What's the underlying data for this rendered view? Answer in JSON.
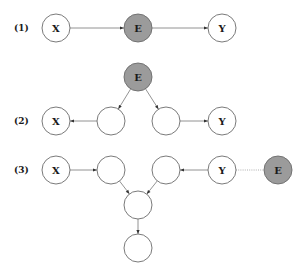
{
  "colors": {
    "observed_fill": "#9b9b9b",
    "hidden_fill": "#ffffff",
    "stroke": "#6b6b6b"
  },
  "rows": [
    {
      "label": "(1)",
      "nodes": [
        {
          "id": "r1x",
          "label": "X",
          "cx": 56,
          "cy": 28,
          "shaded": false
        },
        {
          "id": "r1e",
          "label": "E",
          "cx": 138,
          "cy": 28,
          "shaded": true
        },
        {
          "id": "r1y",
          "label": "Y",
          "cx": 222,
          "cy": 28,
          "shaded": false
        }
      ],
      "edges": [
        {
          "from": "r1x",
          "to": "r1e",
          "style": "arrow"
        },
        {
          "from": "r1e",
          "to": "r1y",
          "style": "arrow"
        }
      ]
    },
    {
      "label": "(2)",
      "nodes": [
        {
          "id": "r2e",
          "label": "E",
          "cx": 138,
          "cy": 77,
          "shaded": true
        },
        {
          "id": "r2a",
          "label": "",
          "cx": 111,
          "cy": 121,
          "shaded": false
        },
        {
          "id": "r2b",
          "label": "",
          "cx": 166,
          "cy": 121,
          "shaded": false
        },
        {
          "id": "r2x",
          "label": "X",
          "cx": 56,
          "cy": 121,
          "shaded": false
        },
        {
          "id": "r2y",
          "label": "Y",
          "cx": 222,
          "cy": 121,
          "shaded": false
        }
      ],
      "edges": [
        {
          "from": "r2e",
          "to": "r2a",
          "style": "arrow"
        },
        {
          "from": "r2e",
          "to": "r2b",
          "style": "arrow"
        },
        {
          "from": "r2a",
          "to": "r2x",
          "style": "arrow"
        },
        {
          "from": "r2b",
          "to": "r2y",
          "style": "arrow"
        }
      ]
    },
    {
      "label": "(3)",
      "nodes": [
        {
          "id": "r3x",
          "label": "X",
          "cx": 56,
          "cy": 170,
          "shaded": false
        },
        {
          "id": "r3a",
          "label": "",
          "cx": 111,
          "cy": 170,
          "shaded": false
        },
        {
          "id": "r3b",
          "label": "",
          "cx": 166,
          "cy": 170,
          "shaded": false
        },
        {
          "id": "r3y",
          "label": "Y",
          "cx": 222,
          "cy": 170,
          "shaded": false
        },
        {
          "id": "r3e",
          "label": "E",
          "cx": 278,
          "cy": 170,
          "shaded": true
        },
        {
          "id": "r3c",
          "label": "",
          "cx": 138,
          "cy": 205,
          "shaded": false
        },
        {
          "id": "r3d",
          "label": "",
          "cx": 138,
          "cy": 248,
          "shaded": false
        }
      ],
      "edges": [
        {
          "from": "r3x",
          "to": "r3a",
          "style": "arrow"
        },
        {
          "from": "r3y",
          "to": "r3b",
          "style": "arrow"
        },
        {
          "from": "r3a",
          "to": "r3c",
          "style": "arrow"
        },
        {
          "from": "r3b",
          "to": "r3c",
          "style": "arrow"
        },
        {
          "from": "r3c",
          "to": "r3d",
          "style": "arrow"
        },
        {
          "from": "r3y",
          "to": "r3e",
          "style": "dotted"
        }
      ]
    }
  ]
}
